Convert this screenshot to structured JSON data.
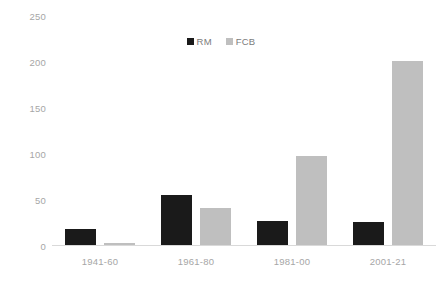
{
  "chart_data": {
    "type": "bar",
    "title": "",
    "subtitle": "",
    "xlabel": "",
    "ylabel": "",
    "categories": [
      "1941-60",
      "1961-80",
      "1981-00",
      "2001-21"
    ],
    "series": [
      {
        "name": "RM",
        "color": "#1a1a1a",
        "values": [
          18,
          55,
          27,
          26
        ]
      },
      {
        "name": "FCB",
        "color": "#bfbfbf",
        "values": [
          3,
          41,
          98,
          201
        ]
      }
    ],
    "ylim": [
      0,
      250
    ],
    "yticks": [
      0,
      50,
      100,
      150,
      200,
      250
    ],
    "ytick_labels": [
      "0",
      "50",
      "100",
      "150",
      "200",
      "250"
    ],
    "grid": false,
    "legend_position": "top-center",
    "legend": [
      {
        "label": "RM",
        "color": "#1a1a1a"
      },
      {
        "label": "FCB",
        "color": "#bfbfbf"
      }
    ],
    "background": "#ffffff",
    "axis_text_color": "#a6a6a6",
    "baseline_color": "#d9d9d9"
  }
}
